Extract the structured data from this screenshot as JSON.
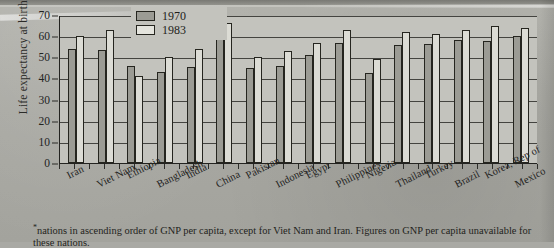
{
  "chart_data": {
    "type": "bar",
    "title": "",
    "xlabel": "",
    "ylabel": "Life expectancy at birth (years)*",
    "ylim": [
      0,
      70
    ],
    "yticks": [
      0,
      10,
      20,
      30,
      40,
      50,
      60,
      70
    ],
    "grid": true,
    "legend_position": "top-center",
    "categories": [
      "Iran",
      "Viet Nam",
      "Ethiopia",
      "Bangladesh",
      "India",
      "China",
      "Pakistan",
      "Indonesia",
      "Egypt",
      "Philippines",
      "Nigeria",
      "Thailand",
      "Turkey",
      "Brazil",
      "Korea, Rep of",
      "Mexico"
    ],
    "series": [
      {
        "name": "1970",
        "color": "#9b9b94",
        "values": [
          54,
          53.5,
          46,
          43,
          45.5,
          60,
          45,
          46,
          51,
          57,
          42.5,
          56,
          56.5,
          58,
          57.5,
          60
        ]
      },
      {
        "name": "1983",
        "color": "#dcdcd5",
        "values": [
          60,
          63,
          41,
          50,
          54,
          66,
          50,
          53,
          57,
          63,
          49,
          62,
          61,
          63,
          65,
          64
        ]
      }
    ],
    "footnote": "*nations in ascending order of GNP per capita, except for Viet Nam and Iran. Figures on GNP per capita unavailable for these nations."
  },
  "legend": {
    "items": [
      {
        "label": "1970"
      },
      {
        "label": "1983"
      }
    ]
  },
  "footnote": {
    "marker": "*",
    "line1": "nations in ascending order of GNP per capita, except for Viet Nam and Iran. Figures on GNP per capita",
    "line2": "unavailable for these nations."
  }
}
